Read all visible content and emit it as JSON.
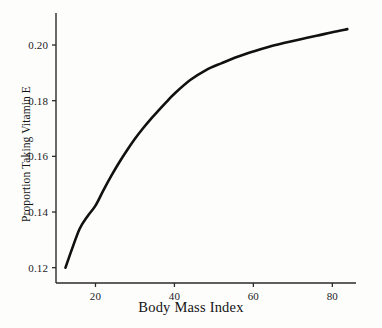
{
  "chart_data": {
    "type": "line",
    "title": "",
    "xlabel": "Body Mass Index",
    "ylabel": "Proportion Taking Vitamin E",
    "xlim": [
      10.0,
      86.0
    ],
    "ylim": [
      0.1145,
      0.2115
    ],
    "xticks": [
      20,
      40,
      60,
      80
    ],
    "xtick_labels": [
      "20",
      "40",
      "60",
      "80"
    ],
    "yticks": [
      0.12,
      0.14,
      0.16,
      0.18,
      0.2
    ],
    "ytick_labels": [
      "0.12",
      "0.14",
      "0.16",
      "0.18",
      "0.20"
    ],
    "grid": false,
    "legend": false,
    "line_color": "#111111",
    "line_width": 2.6,
    "background_color": "#fdfdfc",
    "axis_color": "#2a2a2a",
    "series": [
      {
        "name": "Proportion Taking Vitamin E",
        "x": [
          12.4,
          14,
          16,
          18,
          20,
          22,
          24,
          26,
          28,
          30,
          32,
          34,
          36,
          38,
          40,
          44,
          48,
          52,
          56,
          60,
          64,
          68,
          72,
          76,
          80,
          83.8
        ],
        "y": [
          0.12,
          0.1265,
          0.134,
          0.1385,
          0.1423,
          0.1478,
          0.153,
          0.1578,
          0.1622,
          0.1663,
          0.17,
          0.1734,
          0.1765,
          0.1796,
          0.1825,
          0.1874,
          0.191,
          0.1935,
          0.1958,
          0.1977,
          0.1994,
          0.2008,
          0.2021,
          0.2033,
          0.2046,
          0.2057
        ]
      }
    ]
  },
  "axis_titles": {
    "x": "Body Mass Index",
    "y": "Proportion Taking Vitamin E"
  }
}
